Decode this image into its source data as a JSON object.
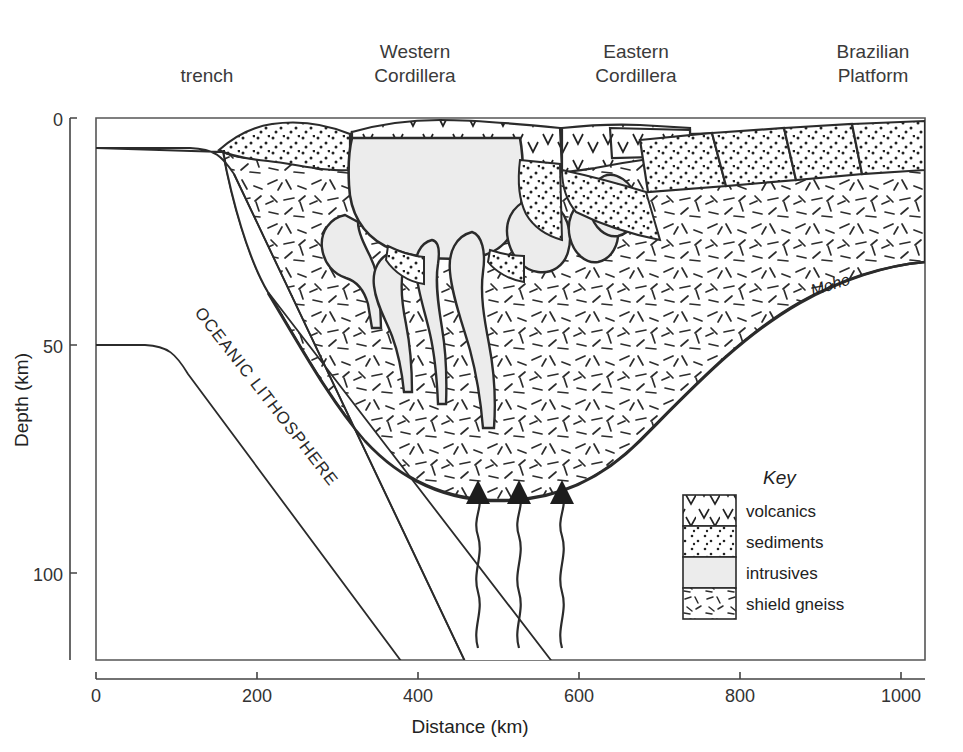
{
  "figure": {
    "type": "geological-cross-section"
  },
  "surface_labels": [
    {
      "name": "trench",
      "lines": [
        "trench"
      ],
      "x": 207,
      "y": 76
    },
    {
      "name": "western-cordillera",
      "lines": [
        "Western",
        "Cordillera"
      ],
      "x": 415,
      "y": 55
    },
    {
      "name": "eastern-cordillera",
      "lines": [
        "Eastern",
        "Cordillera"
      ],
      "x": 636,
      "y": 55
    },
    {
      "name": "brazilian-platform",
      "lines": [
        "Brazilian",
        "Platform"
      ],
      "x": 873,
      "y": 55
    }
  ],
  "axes": {
    "x": {
      "label": "Distance (km)",
      "ticks": [
        {
          "value": 0,
          "text": "0"
        },
        {
          "value": 200,
          "text": "200"
        },
        {
          "value": 400,
          "text": "400"
        },
        {
          "value": 600,
          "text": "600"
        },
        {
          "value": 800,
          "text": "800"
        },
        {
          "value": 1000,
          "text": "1000"
        }
      ],
      "min": 0,
      "max": 1030
    },
    "y": {
      "label": "Depth (km)",
      "ticks": [
        {
          "value": 0,
          "text": "0"
        },
        {
          "value": 50,
          "text": "50"
        },
        {
          "value": 100,
          "text": "100"
        }
      ],
      "min": 0,
      "max": 135
    }
  },
  "annotations": [
    {
      "name": "oceanic-lithosphere",
      "text": "OCEANIC LITHOSPHERE",
      "x": 262,
      "y": 400,
      "rotation": 52
    },
    {
      "name": "moho",
      "text": "Moho",
      "x": 832,
      "y": 290,
      "rotation": -17
    }
  ],
  "legend": {
    "title": "Key",
    "items": [
      {
        "name": "volcanics",
        "label": "volcanics",
        "pattern": "v-marks",
        "fill": "#ffffff"
      },
      {
        "name": "sediments",
        "label": "sediments",
        "pattern": "dots",
        "fill": "#ffffff"
      },
      {
        "name": "intrusives",
        "label": "intrusives",
        "pattern": "solid",
        "fill": "#ececec"
      },
      {
        "name": "shield-gneiss",
        "label": "shield gneiss",
        "pattern": "dashes",
        "fill": "#ffffff"
      }
    ]
  },
  "flow_arrows": {
    "name": "rising-magma-arrows",
    "count": 3,
    "direction": "up",
    "x_positions": [
      478,
      519,
      562
    ],
    "tail_bottom_y": 648,
    "head_y": 490
  },
  "colors": {
    "stroke": "#2b2b2b",
    "intrusive_fill": "#ececec",
    "background": "#ffffff",
    "text": "#222222"
  }
}
